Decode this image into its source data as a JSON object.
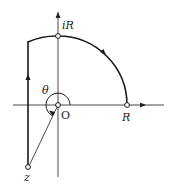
{
  "diagram": {
    "type": "contour-plot",
    "labels": {
      "top_point": "iR",
      "right_point": "R",
      "origin": "O",
      "angle": "θ",
      "bottom_point": "z"
    },
    "colors": {
      "stroke": "#1a1a1a",
      "axis": "#333333",
      "background": "#ffffff"
    }
  }
}
